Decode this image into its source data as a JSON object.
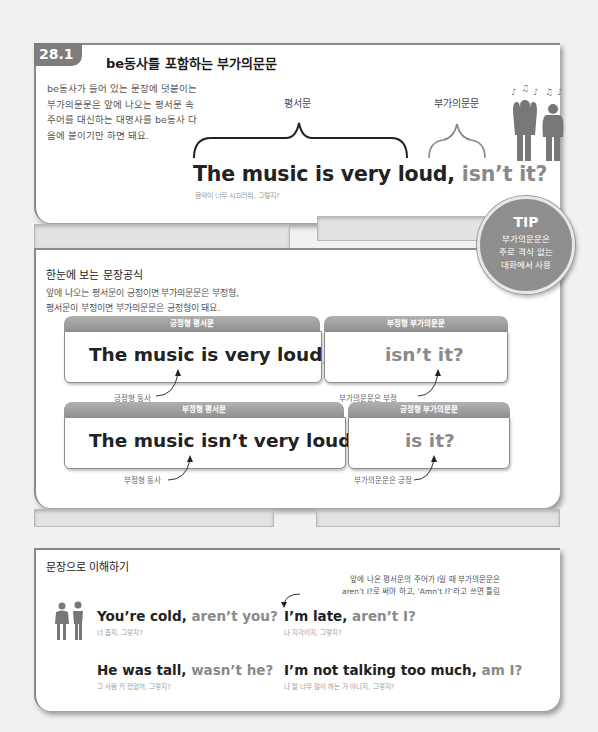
{
  "section1": {
    "number": "28.1",
    "title": "be동사를 포함하는 부가의문문",
    "intro": "be동사가 들어 있는 문장에 덧붙이는 부가의문문은 앞에 나오는 평서문 속 주어를 대신하는 대명사를 be동사 다음에 붙이기만 하면 돼요.",
    "label_statement": "평서문",
    "label_tag": "부가의문문",
    "sentence_main": "The music is very loud,",
    "sentence_tag": "isn’t it?",
    "translation": "음악이 너무 시끄러워, 그렇지?",
    "illustration": "people-covering-ears-music-icon"
  },
  "tip": {
    "title": "TIP",
    "body": [
      "부가의문문은",
      "주로 격식 없는",
      "대화에서 사용"
    ]
  },
  "section2": {
    "title": "한눈에 보는 문장공식",
    "desc": [
      "앞에 나오는 평서문이 긍정이면 부가의문문은 부정형,",
      "평서문이 부정이면 부가의문문은 긍정형이 돼요."
    ],
    "rows": [
      {
        "left_tab": "긍정형 평서문",
        "left_text": "The music is very loud,",
        "right_tab": "부정형 부가의문문",
        "right_text": "isn’t it?",
        "left_note": "긍정형 동사",
        "right_note": "부가의문문은 부정"
      },
      {
        "left_tab": "부정형 평서문",
        "left_text": "The music isn’t very loud,",
        "right_tab": "긍정형 부가의문문",
        "right_text": "is it?",
        "left_note": "부정형 동사",
        "right_note": "부가의문문은 긍정"
      }
    ]
  },
  "section3": {
    "title": "문장으로 이해하기",
    "note": [
      "앞에 나온 평서문의 주어가 I일 때 부가의문문은",
      "aren’t I?로 써야 하고, ‘Amn’t I?’라고 쓰면 틀림"
    ],
    "examples": [
      {
        "main": "You’re cold,",
        "tag": "aren’t you?",
        "trans": "너 춥지, 그렇지?"
      },
      {
        "main": "I’m late,",
        "tag": "aren’t I?",
        "trans": "나 지각이지, 그렇지?"
      },
      {
        "main": "He was tall,",
        "tag": "wasn’t he?",
        "trans": "그 사람 키 컸었어, 그렇지?"
      },
      {
        "main": "I’m not talking too much,",
        "tag": "am I?",
        "trans": "나 말 너무 많이 하는 거 아니지, 그렇지?"
      }
    ],
    "illustration": "shivering-couple-icon"
  },
  "colors": {
    "badge": "#7d7d7d",
    "tag_text": "#8a8a8a",
    "tip_circle": "#8e8e8e",
    "tab": "#9a9a9a"
  }
}
